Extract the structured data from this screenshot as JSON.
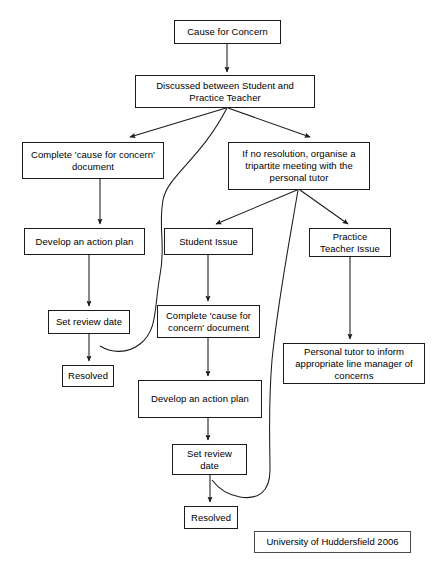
{
  "document": {
    "title": "Cause for Concern Flowchart",
    "credit": "University of Huddersfield 2006",
    "width": 442,
    "height": 566,
    "background_color": "#ffffff",
    "line_color": "#1a1a1a",
    "text_color": "#000000"
  },
  "nodes": [
    {
      "id": "cause",
      "label": "Cause for Concern",
      "x": 174,
      "y": 20,
      "w": 107,
      "h": 24
    },
    {
      "id": "discussed",
      "label": "Discussed between Student and\nPractice Teacher",
      "x": 135,
      "y": 75,
      "w": 180,
      "h": 33
    },
    {
      "id": "complete_left",
      "label": "Complete 'cause for concern'\ndocument",
      "x": 22,
      "y": 142,
      "w": 142,
      "h": 37
    },
    {
      "id": "no_resolution",
      "label": "If no resolution, organise a\ntripartite  meeting with the\npersonal tutor",
      "x": 228,
      "y": 142,
      "w": 142,
      "h": 48
    },
    {
      "id": "develop_left",
      "label": "Develop an action plan",
      "x": 24,
      "y": 228,
      "w": 121,
      "h": 27
    },
    {
      "id": "student_issue",
      "label": "Student Issue",
      "x": 164,
      "y": 228,
      "w": 89,
      "h": 27
    },
    {
      "id": "pt_issue",
      "label": "Practice\nTeacher Issue",
      "x": 309,
      "y": 228,
      "w": 82,
      "h": 29
    },
    {
      "id": "set_review_left",
      "label": "Set review date",
      "x": 48,
      "y": 310,
      "w": 82,
      "h": 24
    },
    {
      "id": "complete_mid",
      "label": "Complete 'cause for\nconcern' document",
      "x": 157,
      "y": 305,
      "w": 103,
      "h": 33
    },
    {
      "id": "personal_tutor",
      "label": "Personal tutor to inform\nappropriate line manager of\nconcerns",
      "x": 283,
      "y": 343,
      "w": 142,
      "h": 41
    },
    {
      "id": "resolved_left",
      "label": "Resolved",
      "x": 62,
      "y": 365,
      "w": 52,
      "h": 22
    },
    {
      "id": "develop_mid",
      "label": "Develop an action plan",
      "x": 138,
      "y": 380,
      "w": 124,
      "h": 38
    },
    {
      "id": "set_review_mid",
      "label": "Set review\ndate",
      "x": 172,
      "y": 444,
      "w": 75,
      "h": 31
    },
    {
      "id": "resolved_mid",
      "label": "Resolved",
      "x": 184,
      "y": 506,
      "w": 54,
      "h": 23
    }
  ],
  "credit_box": {
    "label": "University of Huddersfield 2006",
    "x": 254,
    "y": 531,
    "w": 157,
    "h": 22
  },
  "edges": [
    {
      "id": "e-cause-discussed",
      "from": "cause",
      "to": "discussed",
      "kind": "arrow-straight"
    },
    {
      "id": "e-discussed-complete",
      "from": "discussed",
      "to": "complete_left",
      "kind": "arrow-diagonal"
    },
    {
      "id": "e-discussed-noresolution",
      "from": "discussed",
      "to": "no_resolution",
      "kind": "arrow-diagonal"
    },
    {
      "id": "e-discussed-review-loop",
      "from": "discussed",
      "to": "set_review_left",
      "kind": "curve-feedback"
    },
    {
      "id": "e-complete-develop",
      "from": "complete_left",
      "to": "develop_left",
      "kind": "arrow-straight"
    },
    {
      "id": "e-develop-review",
      "from": "develop_left",
      "to": "set_review_left",
      "kind": "arrow-straight"
    },
    {
      "id": "e-review-resolved",
      "from": "set_review_left",
      "to": "resolved_left",
      "kind": "arrow-straight"
    },
    {
      "id": "e-noresolution-student",
      "from": "no_resolution",
      "to": "student_issue",
      "kind": "arrow-diagonal"
    },
    {
      "id": "e-noresolution-ptissue",
      "from": "no_resolution",
      "to": "pt_issue",
      "kind": "arrow-diagonal"
    },
    {
      "id": "e-noresolution-review-loop",
      "from": "no_resolution",
      "to": "set_review_mid",
      "kind": "curve-feedback"
    },
    {
      "id": "e-student-complete",
      "from": "student_issue",
      "to": "complete_mid",
      "kind": "arrow-straight"
    },
    {
      "id": "e-complete-develop-mid",
      "from": "complete_mid",
      "to": "develop_mid",
      "kind": "arrow-straight"
    },
    {
      "id": "e-develop-review-mid",
      "from": "develop_mid",
      "to": "set_review_mid",
      "kind": "arrow-straight"
    },
    {
      "id": "e-review-resolved-mid",
      "from": "set_review_mid",
      "to": "resolved_mid",
      "kind": "arrow-straight"
    },
    {
      "id": "e-ptissue-tutor",
      "from": "pt_issue",
      "to": "personal_tutor",
      "kind": "arrow-straight"
    }
  ]
}
